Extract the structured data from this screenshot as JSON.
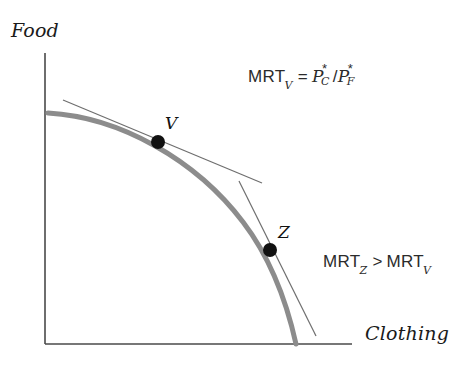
{
  "figure": {
    "background_color": "#ffffff"
  },
  "axes": {
    "y_label": "Food",
    "x_label": "Clothing",
    "axis_color": "#4a4a4a",
    "origin": {
      "x": 45,
      "y": 344
    },
    "y_top": 53,
    "x_right": 352
  },
  "curve": {
    "name": "production-possibility-frontier",
    "color": "#8c8c8c",
    "stroke_width": 5,
    "start": {
      "x": 48,
      "y": 113
    },
    "end": {
      "x": 296,
      "y": 344
    },
    "path": "M 48 113 C 120 117 196 160 243 222 C 272 260 288 308 296 344"
  },
  "points": [
    {
      "label": "V",
      "name": "point-v",
      "x": 158,
      "y": 142,
      "radius": 7,
      "color": "#111111"
    },
    {
      "label": "Z",
      "name": "point-z",
      "x": 270,
      "y": 250,
      "radius": 7,
      "color": "#111111"
    }
  ],
  "tangents": [
    {
      "name": "tangent-line-v",
      "at_point": "V",
      "color": "#6e6e6e",
      "stroke_width": 1.2,
      "x1": 63,
      "y1": 100,
      "x2": 262,
      "y2": 183
    },
    {
      "name": "tangent-line-z",
      "at_point": "Z",
      "color": "#6e6e6e",
      "stroke_width": 1.2,
      "x1": 239,
      "y1": 181,
      "x2": 316,
      "y2": 336
    }
  ],
  "formulas": {
    "mrt_v": {
      "lhs": "MRT",
      "lhs_subscript": "V",
      "equals": "=",
      "numerator_base": "P",
      "numerator_star": "*",
      "numerator_subscript": "C",
      "slash": "/",
      "denominator_base": "P",
      "denominator_star": "*",
      "denominator_subscript": "F"
    },
    "comparison": {
      "left_base": "MRT",
      "left_subscript": "Z",
      "operator": ">",
      "right_base": "MRT",
      "right_subscript": "V"
    }
  },
  "chart_data": {
    "type": "line",
    "xlabel": "Clothing",
    "ylabel": "Food",
    "grid": false,
    "legend": "none",
    "axis_ranges": {
      "x": [
        0,
        1
      ],
      "y": [
        0,
        1
      ]
    },
    "series": [
      {
        "name": "Production possibility frontier",
        "kind": "curve",
        "color": "#8c8c8c",
        "points": [
          {
            "x": 0.012,
            "y": 0.795
          },
          {
            "x": 0.15,
            "y": 0.778
          },
          {
            "x": 0.368,
            "y": 0.7
          },
          {
            "x": 0.46,
            "y": 0.636
          },
          {
            "x": 0.645,
            "y": 0.458
          },
          {
            "x": 0.733,
            "y": 0.322
          },
          {
            "x": 0.818,
            "y": 0.122
          },
          {
            "x": 0.818,
            "y": 0.0
          }
        ]
      },
      {
        "name": "Tangent at V",
        "kind": "tangent",
        "color": "#6e6e6e",
        "points": [
          {
            "x": 0.059,
            "y": 0.841
          },
          {
            "x": 0.707,
            "y": 0.554
          }
        ]
      },
      {
        "name": "Tangent at Z",
        "kind": "tangent",
        "color": "#6e6e6e",
        "points": [
          {
            "x": 0.632,
            "y": 0.561
          },
          {
            "x": 0.883,
            "y": 0.028
          }
        ]
      }
    ],
    "annotations": [
      {
        "label": "V",
        "x": 0.368,
        "y": 0.694,
        "note": "Point V on the frontier"
      },
      {
        "label": "Z",
        "x": 0.733,
        "y": 0.325,
        "note": "Point Z on the frontier"
      },
      {
        "label": "MRT_V = P*_C/P*_F",
        "x": 0.66,
        "y": 0.9
      },
      {
        "label": "MRT_Z > MRT_V",
        "x": 0.905,
        "y": 0.29
      }
    ]
  }
}
